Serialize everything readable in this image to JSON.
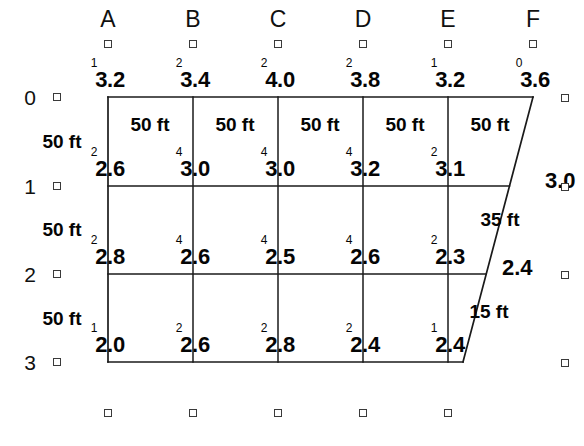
{
  "diagram": {
    "line_color": "#1a1a1a",
    "marker_color": "#3a3a3a",
    "columns": [
      {
        "letter": "A",
        "x": 108
      },
      {
        "letter": "B",
        "x": 193
      },
      {
        "letter": "C",
        "x": 278
      },
      {
        "letter": "D",
        "x": 363
      },
      {
        "letter": "E",
        "x": 448
      },
      {
        "letter": "F",
        "x": 533
      }
    ],
    "rows": [
      {
        "number": "0",
        "y": 97
      },
      {
        "number": "1",
        "y": 186
      },
      {
        "number": "2",
        "y": 274
      },
      {
        "number": "3",
        "y": 362
      }
    ],
    "nodes": [
      {
        "row": "0",
        "col": "A",
        "sup": "1",
        "value": "3.2",
        "x": 108,
        "y": 97
      },
      {
        "row": "0",
        "col": "B",
        "sup": "2",
        "value": "3.4",
        "x": 193,
        "y": 97
      },
      {
        "row": "0",
        "col": "C",
        "sup": "2",
        "value": "4.0",
        "x": 278,
        "y": 97
      },
      {
        "row": "0",
        "col": "D",
        "sup": "2",
        "value": "3.8",
        "x": 363,
        "y": 97
      },
      {
        "row": "0",
        "col": "E",
        "sup": "1",
        "value": "3.2",
        "x": 448,
        "y": 97
      },
      {
        "row": "0",
        "col": "F",
        "sup": "0",
        "value": "3.6",
        "x": 533,
        "y": 97
      },
      {
        "row": "1",
        "col": "A",
        "sup": "2",
        "value": "2.6",
        "x": 108,
        "y": 186
      },
      {
        "row": "1",
        "col": "B",
        "sup": "4",
        "value": "3.0",
        "x": 193,
        "y": 186
      },
      {
        "row": "1",
        "col": "C",
        "sup": "4",
        "value": "3.0",
        "x": 278,
        "y": 186
      },
      {
        "row": "1",
        "col": "D",
        "sup": "4",
        "value": "3.2",
        "x": 363,
        "y": 186
      },
      {
        "row": "1",
        "col": "E",
        "sup": "2",
        "value": "3.1",
        "x": 448,
        "y": 186
      },
      {
        "row": "2",
        "col": "A",
        "sup": "2",
        "value": "2.8",
        "x": 108,
        "y": 274
      },
      {
        "row": "2",
        "col": "B",
        "sup": "4",
        "value": "2.6",
        "x": 193,
        "y": 274
      },
      {
        "row": "2",
        "col": "C",
        "sup": "4",
        "value": "2.5",
        "x": 278,
        "y": 274
      },
      {
        "row": "2",
        "col": "D",
        "sup": "4",
        "value": "2.6",
        "x": 363,
        "y": 274
      },
      {
        "row": "2",
        "col": "E",
        "sup": "2",
        "value": "2.3",
        "x": 448,
        "y": 274
      },
      {
        "row": "3",
        "col": "A",
        "sup": "1",
        "value": "2.0",
        "x": 108,
        "y": 362
      },
      {
        "row": "3",
        "col": "B",
        "sup": "2",
        "value": "2.6",
        "x": 193,
        "y": 362
      },
      {
        "row": "3",
        "col": "C",
        "sup": "2",
        "value": "2.8",
        "x": 278,
        "y": 362
      },
      {
        "row": "3",
        "col": "D",
        "sup": "2",
        "value": "2.4",
        "x": 363,
        "y": 362
      },
      {
        "row": "3",
        "col": "E",
        "sup": "1",
        "value": "2.4",
        "x": 448,
        "y": 362
      }
    ],
    "edge_values": [
      {
        "value": "3.0",
        "x": 545,
        "y": 181
      },
      {
        "value": "2.4",
        "x": 502,
        "y": 268
      }
    ],
    "horizontal_dims": [
      {
        "label": "50 ft",
        "x": 150,
        "y": 124
      },
      {
        "label": "50 ft",
        "x": 235,
        "y": 124
      },
      {
        "label": "50 ft",
        "x": 320,
        "y": 124
      },
      {
        "label": "50 ft",
        "x": 405,
        "y": 124
      },
      {
        "label": "50 ft",
        "x": 490,
        "y": 124
      }
    ],
    "vertical_dims": [
      {
        "label": "50 ft",
        "x": 62,
        "y": 141
      },
      {
        "label": "50 ft",
        "x": 62,
        "y": 229
      },
      {
        "label": "50 ft",
        "x": 62,
        "y": 318
      }
    ],
    "slant_dims": [
      {
        "label": "35 ft",
        "x": 500,
        "y": 219
      },
      {
        "label": "15 ft",
        "x": 489,
        "y": 311
      }
    ],
    "row_markers": [
      {
        "x": 57,
        "y": 97
      },
      {
        "x": 57,
        "y": 186
      },
      {
        "x": 57,
        "y": 274
      },
      {
        "x": 57,
        "y": 362
      }
    ],
    "column_markers": [
      {
        "x": 108,
        "y": 44
      },
      {
        "x": 193,
        "y": 44
      },
      {
        "x": 278,
        "y": 44
      },
      {
        "x": 363,
        "y": 44
      },
      {
        "x": 448,
        "y": 44
      },
      {
        "x": 533,
        "y": 44
      }
    ],
    "right_markers": [
      {
        "x": 565,
        "y": 98
      },
      {
        "x": 565,
        "y": 187
      },
      {
        "x": 565,
        "y": 275
      },
      {
        "x": 565,
        "y": 363
      }
    ],
    "bottom_markers": [
      {
        "x": 108,
        "y": 413
      },
      {
        "x": 193,
        "y": 413
      },
      {
        "x": 278,
        "y": 413
      },
      {
        "x": 363,
        "y": 413
      },
      {
        "x": 448,
        "y": 413
      }
    ],
    "boundary": {
      "top": {
        "x1": 108,
        "y1": 97,
        "x2": 533,
        "y2": 97
      },
      "left": {
        "x1": 108,
        "y1": 97,
        "x2": 108,
        "y2": 362
      },
      "bottom": {
        "x1": 108,
        "y1": 362,
        "x2": 463,
        "y2": 362
      },
      "slant": {
        "x1": 533,
        "y1": 97,
        "x2": 463,
        "y2": 362
      }
    },
    "interior_verticals": [
      {
        "x": 193,
        "y1": 97,
        "y2": 362
      },
      {
        "x": 278,
        "y1": 97,
        "y2": 362
      },
      {
        "x": 363,
        "y1": 97,
        "y2": 362
      },
      {
        "x": 448,
        "y1": 97,
        "y2": 362
      }
    ],
    "interior_horizontals": [
      {
        "y": 186,
        "x1": 108,
        "x2": 510
      },
      {
        "y": 274,
        "x1": 108,
        "x2": 487
      }
    ]
  }
}
